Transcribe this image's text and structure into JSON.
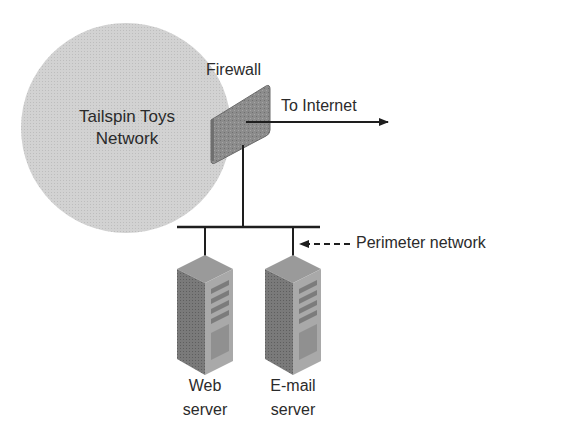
{
  "diagram": {
    "network": {
      "label_line1": "Tailspin Toys",
      "label_line2": "Network",
      "fill": "#cfcfcf"
    },
    "firewall": {
      "label": "Firewall",
      "fill": "#8f8f8f"
    },
    "internet": {
      "label": "To Internet"
    },
    "perimeter": {
      "label": "Perimeter network"
    },
    "servers": [
      {
        "label_line1": "Web",
        "label_line2": "server"
      },
      {
        "label_line1": "E-mail",
        "label_line2": "server"
      }
    ],
    "colors": {
      "line": "#1e1e1e",
      "server_dark": "#6e6e6e",
      "server_light": "#a8a8a8"
    }
  }
}
